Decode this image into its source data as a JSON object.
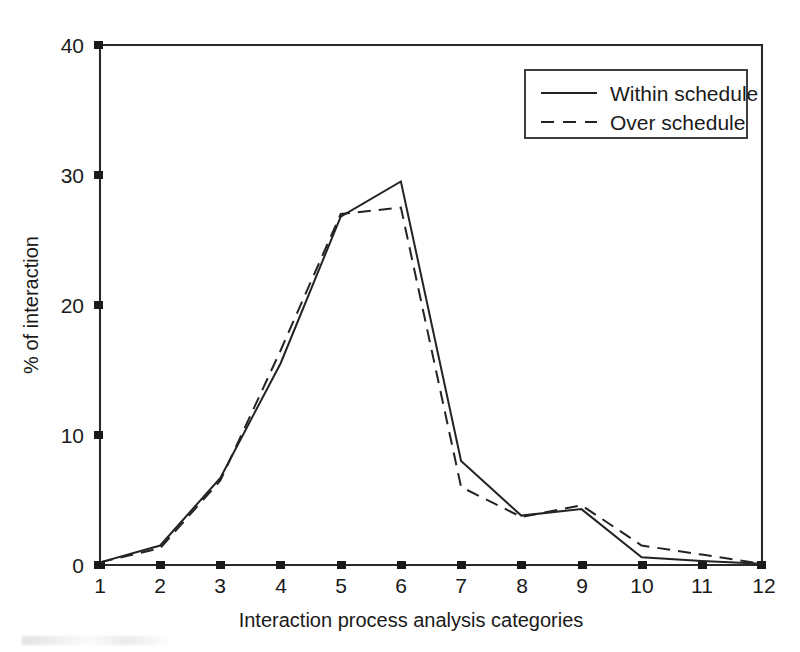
{
  "figure": {
    "background_color": "#ffffff",
    "line_color": "#232323"
  },
  "chart_data": {
    "type": "line",
    "title": "",
    "xlabel": "Interaction process analysis categories",
    "ylabel": "% of interaction",
    "categories": [
      "1",
      "2",
      "3",
      "4",
      "5",
      "6",
      "7",
      "8",
      "9",
      "10",
      "11",
      "12"
    ],
    "x": [
      1,
      2,
      3,
      4,
      5,
      6,
      7,
      8,
      9,
      10,
      11,
      12
    ],
    "xlim": [
      1,
      12
    ],
    "ylim": [
      0,
      40
    ],
    "xticks": [
      "1",
      "2",
      "3",
      "4",
      "5",
      "6",
      "7",
      "8",
      "9",
      "10",
      "11",
      "12"
    ],
    "yticks": [
      "0",
      "10",
      "20",
      "30",
      "40"
    ],
    "grid": false,
    "legend_position": "top-right",
    "series": [
      {
        "name": "Within schedule",
        "style": "solid",
        "values": [
          0.2,
          1.5,
          6.7,
          15.5,
          26.8,
          29.5,
          8.0,
          3.8,
          4.3,
          0.6,
          0.3,
          0.1
        ]
      },
      {
        "name": "Over schedule",
        "style": "dashed",
        "values": [
          0.2,
          1.3,
          6.5,
          16.5,
          27.0,
          27.5,
          6.0,
          3.7,
          4.6,
          1.5,
          0.8,
          0.1
        ]
      }
    ]
  },
  "legend": {
    "items": [
      {
        "label": "Within schedule",
        "style": "solid"
      },
      {
        "label": "Over schedule",
        "style": "dashed"
      }
    ]
  }
}
